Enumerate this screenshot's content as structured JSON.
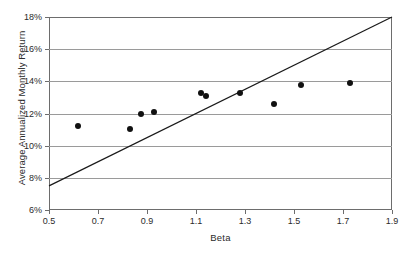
{
  "chart_data": {
    "type": "scatter",
    "title": "",
    "xlabel": "Beta",
    "ylabel": "Average Annualized Monthly Return",
    "xlim": [
      0.5,
      1.9
    ],
    "ylim": [
      6,
      18
    ],
    "grid": true,
    "legend": null,
    "xticks": [
      "0.5",
      "0.7",
      "0.9",
      "1.1",
      "1.3",
      "1.5",
      "1.7",
      "1.9"
    ],
    "xtick_values": [
      0.5,
      0.7,
      0.9,
      1.1,
      1.3,
      1.5,
      1.7,
      1.9
    ],
    "yticks": [
      "6%",
      "8%",
      "10%",
      "12%",
      "14%",
      "16%",
      "18%"
    ],
    "ytick_values": [
      6,
      8,
      10,
      12,
      14,
      16,
      18
    ],
    "points": [
      {
        "x": 0.62,
        "y": 11.2
      },
      {
        "x": 0.83,
        "y": 11.05
      },
      {
        "x": 0.875,
        "y": 11.95
      },
      {
        "x": 0.93,
        "y": 12.1
      },
      {
        "x": 1.12,
        "y": 13.25
      },
      {
        "x": 1.14,
        "y": 13.1
      },
      {
        "x": 1.28,
        "y": 13.25
      },
      {
        "x": 1.42,
        "y": 12.6
      },
      {
        "x": 1.53,
        "y": 13.75
      },
      {
        "x": 1.73,
        "y": 13.9
      }
    ],
    "series": [
      {
        "name": "Average Annualized Monthly Return",
        "type": "scatter",
        "marker": "circle",
        "color": "#111111",
        "x": [
          0.62,
          0.83,
          0.875,
          0.93,
          1.12,
          1.14,
          1.28,
          1.42,
          1.53,
          1.73
        ],
        "values": [
          11.2,
          11.05,
          11.95,
          12.1,
          13.25,
          13.1,
          13.25,
          12.6,
          13.75,
          13.9
        ]
      },
      {
        "name": "Security Market Line",
        "type": "line",
        "color": "#1a1a1a",
        "x": [
          0.5,
          1.9
        ],
        "values": [
          7.5,
          18.0
        ]
      }
    ],
    "trend_line": {
      "x_start": 0.5,
      "y_start": 7.5,
      "x_end": 1.9,
      "y_end": 18.0,
      "color": "#1a1a1a"
    },
    "colors": {
      "point": "#111111",
      "line": "#1a1a1a",
      "grid": "#9a9a9a",
      "axis": "#6d6d6d",
      "text": "#2b2b2b",
      "background": "#ffffff"
    }
  }
}
